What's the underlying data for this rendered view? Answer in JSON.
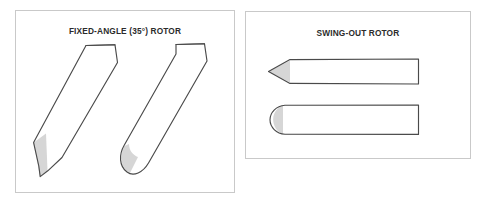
{
  "figure": {
    "background_color": "#ffffff",
    "panels": [
      {
        "id": "fixed-angle",
        "title": "FIXED-ANGLE (35°) ROTOR",
        "tubes": [
          {
            "name": "conical-bottom-tube-tilted",
            "bottom_shape": "pointed",
            "tilt_degrees": 35
          },
          {
            "name": "round-bottom-tube-tilted",
            "bottom_shape": "rounded",
            "tilt_degrees": 35
          }
        ]
      },
      {
        "id": "swing-out",
        "title": "SWING-OUT ROTOR",
        "tubes": [
          {
            "name": "conical-bottom-tube-horizontal",
            "bottom_shape": "pointed",
            "tilt_degrees": 0
          },
          {
            "name": "round-bottom-tube-horizontal",
            "bottom_shape": "rounded",
            "tilt_degrees": 0
          }
        ]
      }
    ]
  },
  "colors": {
    "panel_border": "#c9c9c9",
    "tube_outline": "#4a4a4a",
    "tube_fill": "#ffffff",
    "sediment_fill": "#d6d6d6",
    "title_text": "#2b2b2b"
  }
}
